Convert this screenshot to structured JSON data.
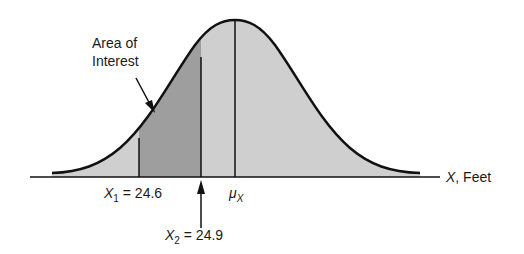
{
  "diagram": {
    "type": "normal-distribution",
    "annotation": {
      "line1": "Area of",
      "line2": "Interest"
    },
    "axis": {
      "variable": "X",
      "unit_label": ", Feet"
    },
    "markers": {
      "x1": {
        "symbol": "X",
        "subscript": "1",
        "value_text": " = 24.6",
        "value": 24.6
      },
      "x2": {
        "symbol": "X",
        "subscript": "2",
        "value_text": " = 24.9",
        "value": 24.9
      },
      "mean": {
        "symbol": "μ",
        "subscript": "X"
      }
    },
    "colors": {
      "curve": "#111111",
      "light_fill": "#c9c9c9",
      "dark_fill": "#9a9a9a",
      "background": "#ffffff"
    }
  }
}
